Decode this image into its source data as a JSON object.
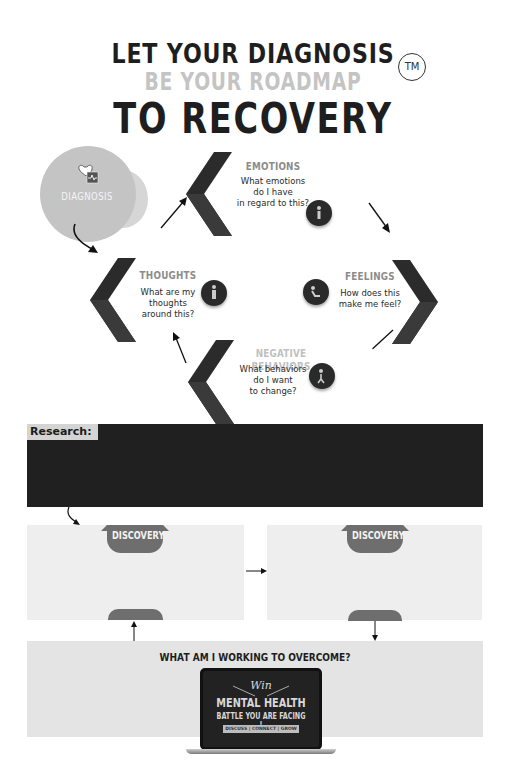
{
  "header": {
    "line1": "LET YOUR DIAGNOSIS",
    "line2": "BE YOUR ROADMAP",
    "line3": "TO RECOVERY",
    "trademark": "TM"
  },
  "diagnosis": {
    "label": "DIAGNOSIS",
    "icon": "heart-clipboard-icon"
  },
  "cycle": [
    {
      "title": "EMOTIONS",
      "text_lines": [
        "What emotions",
        "do I have",
        "in regard to this?"
      ],
      "icon": "person-icon"
    },
    {
      "title": "FEELINGS",
      "text_lines": [
        "How does this",
        "make me feel?"
      ],
      "icon": "sitting-person-icon"
    },
    {
      "title": "NEGATIVE BEHAVIORS",
      "text_lines": [
        "What behaviors",
        "do I want",
        "to change?"
      ],
      "icon": "walking-person-icon"
    },
    {
      "title": "THOUGHTS",
      "text_lines": [
        "What are my",
        "thoughts",
        "around this?"
      ],
      "icon": "thinking-person-icon"
    }
  ],
  "research": {
    "label": "Research:"
  },
  "discovery": {
    "left_label": "DISCOVERY",
    "right_label": "DISCOVERY"
  },
  "overcome": {
    "title": "WHAT AM I WORKING TO OVERCOME?",
    "laptop": {
      "script": "Win",
      "headline": "MENTAL HEALTH",
      "subline": "BATTLE YOU ARE FACING !",
      "pill": "DISCUSS | CONNECT | GROW"
    }
  },
  "colors": {
    "dark": "#1e1e1e",
    "light_gray_text": "#c4c4c4",
    "diagnosis_circle": "#c4c4c4",
    "research_box": "#202020",
    "discovery_box": "#eeeeee",
    "discovery_tab": "#6e6e6e",
    "overcome_box": "#e4e4e4"
  }
}
